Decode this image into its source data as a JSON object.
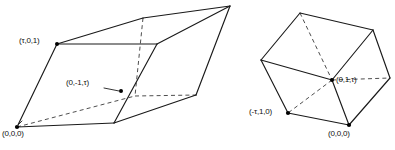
{
  "figure": {
    "background_color": "#ffffff",
    "line_color": "#1a1a1a",
    "hidden_line_color": "#3a3a3a",
    "vertex_color": "#000000",
    "left_solid": {
      "name": "elongated-parallelepiped",
      "labels": [
        {
          "id": "left-label-tau01",
          "text": "(τ,0,1)",
          "x": 19,
          "y": 37
        },
        {
          "id": "left-label-0m1tau",
          "text": "(0,-1,τ)",
          "x": 66,
          "y": 79
        },
        {
          "id": "left-label-origin",
          "text": "(0,0,0)",
          "x": 2,
          "y": 130
        }
      ]
    },
    "right_solid": {
      "name": "cube-parallelepiped",
      "labels": [
        {
          "id": "right-label-01tau",
          "text": "(0,1,τ)",
          "x": 336,
          "y": 76
        },
        {
          "id": "right-label-mtau10",
          "text": "(-τ,1,0)",
          "x": 249,
          "y": 108
        },
        {
          "id": "right-label-origin",
          "text": "(0,0,0)",
          "x": 328,
          "y": 130
        }
      ]
    }
  }
}
